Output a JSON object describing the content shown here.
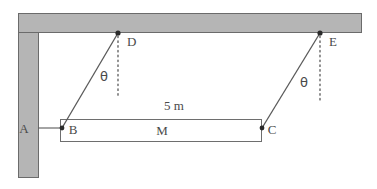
{
  "figure": {
    "type": "physics-free-body-diagram",
    "labels": {
      "wall_point": "A",
      "bar_left_end": "B",
      "bar_right_end": "C",
      "ceiling_anchor_left": "D",
      "ceiling_anchor_right": "E",
      "block": "M",
      "length": "5 m",
      "angle_left": "θ",
      "angle_right": "θ"
    },
    "colors": {
      "wall_fill": "#b5b5b5",
      "wall_stroke": "#6b6b6b",
      "line": "#5a5a5a",
      "bar_stroke": "#6e6e6e",
      "text": "#4a4a4a",
      "background": "#ffffff",
      "dot": "#2b2b2b"
    },
    "geometry": {
      "wall_column": {
        "x": 18,
        "y": 13,
        "width": 20,
        "height": 165
      },
      "wall_beam": {
        "x": 18,
        "y": 13,
        "width": 344,
        "height": 20
      },
      "bar": {
        "x": 60,
        "y": 119,
        "width": 202,
        "height": 23
      },
      "point_A": {
        "x": 28,
        "y": 128
      },
      "point_B": {
        "x": 62,
        "y": 128
      },
      "point_C": {
        "x": 262,
        "y": 128
      },
      "point_D": {
        "x": 118,
        "y": 33
      },
      "point_E": {
        "x": 320,
        "y": 33
      }
    }
  }
}
